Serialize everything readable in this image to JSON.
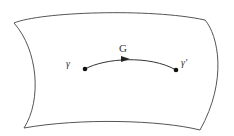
{
  "diagram": {
    "surface": {
      "stroke": "#555555"
    },
    "path": {
      "label": "G",
      "start_label": "γ",
      "end_label": "γ'",
      "color": "#333333"
    }
  }
}
